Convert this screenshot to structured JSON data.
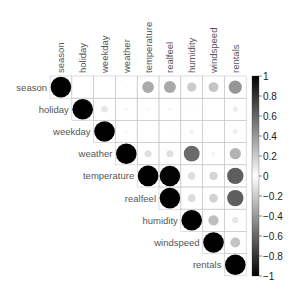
{
  "chart_data": {
    "type": "heatmap",
    "subtype": "correlation-circle-upper",
    "title": "",
    "variables": [
      "season",
      "holiday",
      "weekday",
      "weather",
      "temperature",
      "realfeel",
      "humidity",
      "windspeed",
      "rentals"
    ],
    "matrix": [
      [
        1.0,
        0.01,
        -0.0,
        0.02,
        0.33,
        0.34,
        0.2,
        -0.23,
        0.41
      ],
      [
        0.01,
        1.0,
        -0.1,
        -0.03,
        -0.03,
        -0.03,
        -0.02,
        0.01,
        -0.07
      ],
      [
        -0.0,
        -0.1,
        1.0,
        0.03,
        -0.0,
        -0.01,
        -0.05,
        0.01,
        0.06
      ],
      [
        0.02,
        -0.03,
        0.03,
        1.0,
        -0.12,
        -0.12,
        0.59,
        0.04,
        -0.3
      ],
      [
        0.33,
        -0.03,
        -0.0,
        -0.12,
        1.0,
        0.99,
        0.13,
        -0.16,
        0.63
      ],
      [
        0.34,
        -0.03,
        -0.01,
        -0.12,
        0.99,
        1.0,
        0.14,
        -0.18,
        0.63
      ],
      [
        0.2,
        -0.02,
        -0.05,
        0.59,
        0.13,
        0.14,
        1.0,
        -0.25,
        -0.1
      ],
      [
        -0.23,
        0.01,
        0.01,
        0.04,
        -0.16,
        -0.18,
        -0.25,
        1.0,
        -0.23
      ],
      [
        0.41,
        -0.07,
        0.06,
        -0.3,
        0.63,
        0.63,
        -0.1,
        -0.23,
        1.0
      ]
    ],
    "colorbar": {
      "ticks": [
        "1",
        "0.8",
        "0.6",
        "0.4",
        "0.2",
        "0",
        "−0.2",
        "−0.4",
        "−0.6",
        "−0.8",
        "−1"
      ],
      "range": [
        -1,
        1
      ],
      "colormap": "grayscale: black(-1) to white(0) to black(1)"
    },
    "layout": {
      "grid": true,
      "legend_position": "right",
      "triangle": "upper"
    }
  },
  "colors": {
    "grid": "#c8c8c8",
    "label": "#555555",
    "strong": "#000000",
    "zero": "#ffffff"
  }
}
